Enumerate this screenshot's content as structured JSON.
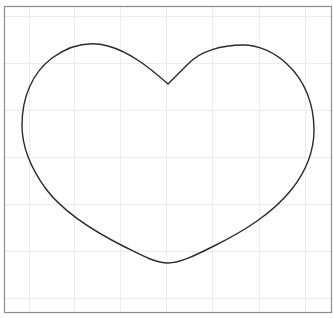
{
  "canvas": {
    "width": 333,
    "height": 318,
    "background": "#ffffff"
  },
  "frame": {
    "x": 4.5,
    "y": 6.5,
    "width": 327,
    "height": 306,
    "stroke": "#8c8c8c",
    "stroke_width": 1.2
  },
  "grid": {
    "stroke": "#ececec",
    "stroke_width": 1,
    "vertical_x": [
      29,
      74,
      120,
      166,
      212,
      259,
      305
    ],
    "horizontal_y": [
      16,
      63,
      110,
      157,
      204,
      251,
      298
    ]
  },
  "shape": {
    "name": "heart",
    "stroke": "#2b2b2b",
    "stroke_width": 1.4,
    "fill": "none",
    "path": "M168,84 C150,68 130,52 108,46 C90,41 70,45 52,58 C32,73 22,98 22,125 C22,150 32,170 46,189 C64,213 95,232 125,247 C143,256 156,263 168,263 C180,263 196,255 214,246 C244,231 272,214 292,189 C306,171 314,152 314,130 C314,103 304,80 288,65 C275,52 258,45 243,45 C222,45 200,51 188,64 C180,72 174,78 168,84 Z"
  }
}
